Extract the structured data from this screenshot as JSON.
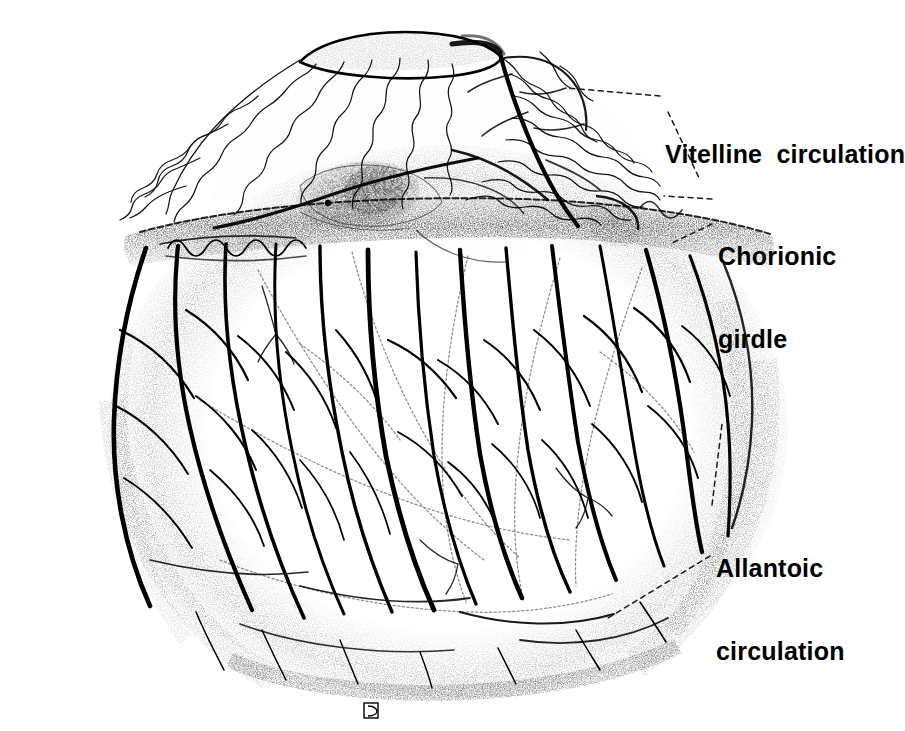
{
  "figure": {
    "kind": "scientific-illustration",
    "background_color": "#ffffff",
    "ink_color": "#000000",
    "width": 897,
    "height": 731
  },
  "labels": {
    "vitelline": {
      "text": "Vitelline  circulation",
      "word1": "Vitelline",
      "word2": "circulation",
      "x": 665,
      "y": 86
    },
    "chorionic": {
      "line1": "Chorionic",
      "line2": "girdle",
      "x": 718,
      "y": 188
    },
    "allantoic": {
      "line1": "Allantoic",
      "line2": "circulation",
      "x": 716,
      "y": 500
    }
  },
  "leaders": [
    {
      "name": "vitelline-upper",
      "from": [
        660,
        96
      ],
      "to": [
        567,
        88
      ]
    },
    {
      "name": "vitelline-lower",
      "from": [
        668,
        110
      ],
      "to": [
        700,
        180
      ]
    },
    {
      "name": "chorionic-upper",
      "from": [
        712,
        199
      ],
      "to": [
        665,
        196
      ]
    },
    {
      "name": "chorionic-lower",
      "from": [
        712,
        224
      ],
      "to": [
        672,
        243
      ]
    },
    {
      "name": "allantoic-upper",
      "from": [
        712,
        505
      ],
      "to": [
        722,
        425
      ]
    },
    {
      "name": "allantoic-lower",
      "from": [
        710,
        556
      ],
      "to": [
        610,
        618
      ]
    }
  ],
  "signature": {
    "mark": "D",
    "x": 370,
    "y": 710
  },
  "regions": {
    "vitelline_dome": {
      "description": "Upper dome with fine wavy vitelline vessels radiating from umbilical opening",
      "vessel_style": "thin sinusoidal wavy lines"
    },
    "chorionic_girdle": {
      "description": "Dense stippled transverse band encircling the conceptus",
      "band_top": 228,
      "band_bottom": 258
    },
    "allantoic_sac": {
      "description": "Lower ovoid body covered by thick branching allantoic vessels",
      "vessel_style": "heavy tapering branched vessels"
    },
    "embryo": {
      "description": "Densely stippled embryo proper visible at centre beneath girdle",
      "x": 330,
      "y": 175
    },
    "umbilical_opening": {
      "description": "Crescent opening at apex of dome",
      "x": 300,
      "y": 35
    }
  }
}
